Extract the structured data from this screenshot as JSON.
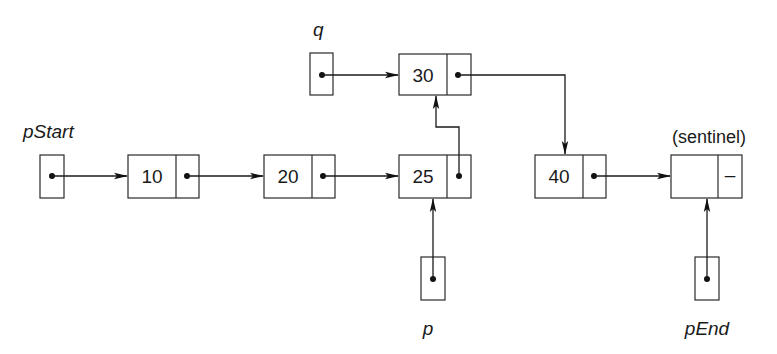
{
  "diagram": {
    "type": "linked-list",
    "pointers": {
      "pStart": {
        "label": "pStart",
        "target": "node_10"
      },
      "q": {
        "label": "q",
        "target": "node_30"
      },
      "p": {
        "label": "p",
        "target": "node_25"
      },
      "pEnd": {
        "label": "pEnd",
        "target": "sentinel"
      }
    },
    "nodes": [
      {
        "id": "node_10",
        "value": "10",
        "next": "node_20"
      },
      {
        "id": "node_20",
        "value": "20",
        "next": "node_25"
      },
      {
        "id": "node_25",
        "value": "25",
        "next": "node_30"
      },
      {
        "id": "node_30",
        "value": "30",
        "next": "node_40"
      },
      {
        "id": "node_40",
        "value": "40",
        "next": "sentinel"
      },
      {
        "id": "sentinel",
        "value": "",
        "next_symbol": "–",
        "caption": "(sentinel)"
      }
    ]
  }
}
